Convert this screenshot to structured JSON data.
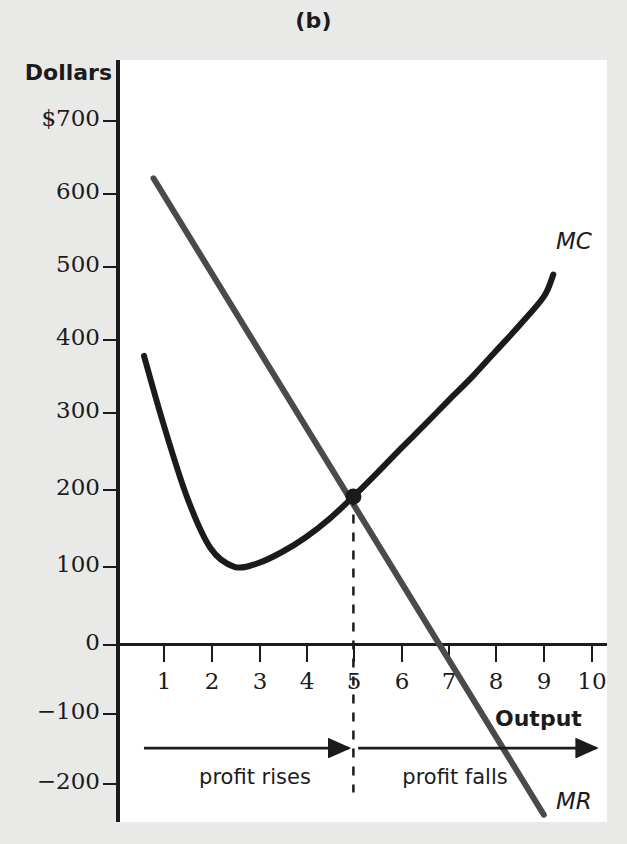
{
  "figure": {
    "panel_label": "(b)",
    "y_axis_title": "Dollars",
    "x_axis_title": "Output"
  },
  "labels": {
    "mc": "MC",
    "mr": "MR",
    "profit_rises": "profit rises",
    "profit_falls": "profit falls"
  },
  "chart_data": {
    "type": "line",
    "title": "(b)",
    "xlabel": "Output",
    "ylabel": "Dollars",
    "xlim": [
      0,
      10.3
    ],
    "ylim": [
      -240,
      730
    ],
    "grid": false,
    "legend_position": "inline-curve-labels",
    "x_ticks": [
      1,
      2,
      3,
      4,
      5,
      6,
      7,
      8,
      9,
      10
    ],
    "x_tick_labels": [
      "1",
      "2",
      "3",
      "4",
      "5",
      "6",
      "7",
      "8",
      "9",
      "10"
    ],
    "y_ticks": [
      700,
      600,
      500,
      400,
      300,
      200,
      100,
      0,
      -100,
      -200
    ],
    "y_tick_labels": [
      "$700",
      "600",
      "500",
      "400",
      "300",
      "200",
      "100",
      "0",
      "−100",
      "−200"
    ],
    "series": [
      {
        "name": "MC",
        "label": "MC",
        "type": "curve",
        "x": [
          0.6,
          1.0,
          1.5,
          2.0,
          2.5,
          3.0,
          3.5,
          4.0,
          4.5,
          5.0,
          5.5,
          6.0,
          6.5,
          7.0,
          7.5,
          8.0,
          8.5,
          9.0,
          9.2
        ],
        "values": [
          390,
          300,
          200,
          130,
          105,
          110,
          125,
          145,
          170,
          200,
          232,
          265,
          297,
          330,
          362,
          397,
          432,
          470,
          500
        ]
      },
      {
        "name": "MR",
        "label": "MR",
        "type": "line",
        "x": [
          0.8,
          9.0
        ],
        "values": [
          630,
          -230
        ]
      }
    ],
    "annotations": [
      {
        "name": "equilibrium-point",
        "x": 5,
        "y": 200,
        "marker": "filled-dot",
        "note": "MR = MC intersection"
      },
      {
        "name": "equilibrium-dropline",
        "x": 5,
        "y_from": 200,
        "y_to": -200,
        "style": "dashed"
      },
      {
        "name": "profit-rises-arrow",
        "text": "profit rises",
        "x_from": 0.6,
        "x_to": 4.9,
        "y": -140
      },
      {
        "name": "profit-falls-arrow",
        "text": "profit falls",
        "x_from": 5.1,
        "x_to": 10.1,
        "y": -140
      }
    ]
  },
  "colors": {
    "ink": "#1b1b1b",
    "mc_curve": "#1b1b1b",
    "mr_line": "#4a4a4a",
    "panel_bg": "#ffffff",
    "page_bg": "#e9e9e7"
  }
}
